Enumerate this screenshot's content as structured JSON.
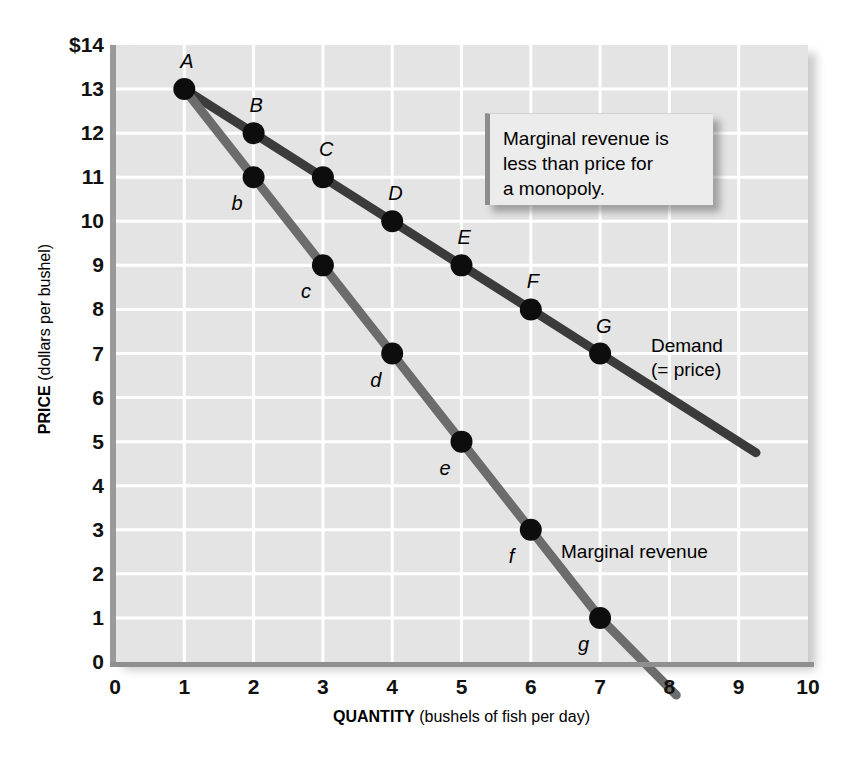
{
  "chart_data": {
    "type": "line",
    "title": "",
    "xlabel": "QUANTITY (bushels of fish per day)",
    "ylabel": "PRICE (dollars per bushel)",
    "xlabel_bold": "QUANTITY",
    "xlabel_rest": " (bushels of fish per day)",
    "ylabel_bold": "PRICE",
    "ylabel_rest": " (dollars per bushel)",
    "xlim": [
      0,
      10
    ],
    "ylim": [
      0,
      14
    ],
    "grid": true,
    "legend_position": "inline-annotation",
    "xticks": [
      "0",
      "1",
      "2",
      "3",
      "4",
      "5",
      "6",
      "7",
      "8",
      "9",
      "10"
    ],
    "yticks": [
      "$14",
      "13",
      "12",
      "11",
      "10",
      "9",
      "8",
      "7",
      "6",
      "5",
      "4",
      "3",
      "2",
      "1",
      "0"
    ],
    "series": [
      {
        "name": "Demand (= price)",
        "color": "#3b3b3b",
        "label_line1": "Demand",
        "label_line2": "(= price)",
        "x": [
          1,
          2,
          3,
          4,
          5,
          6,
          7
        ],
        "values": [
          13,
          12,
          11,
          10,
          9,
          8,
          7
        ],
        "point_labels": [
          "A",
          "B",
          "C",
          "D",
          "E",
          "F",
          "G"
        ],
        "extends_to_x": 9.25,
        "extends_to_y": 4.75
      },
      {
        "name": "Marginal revenue",
        "color": "#6c6c6c",
        "label_line1": "Marginal revenue",
        "label_line2": "",
        "x": [
          1,
          2,
          3,
          4,
          5,
          6,
          7
        ],
        "values": [
          13,
          11,
          9,
          7,
          5,
          3,
          1
        ],
        "point_labels": [
          "A",
          "b",
          "c",
          "d",
          "e",
          "f",
          "g"
        ],
        "extends_to_x": 8.1,
        "extends_to_y": -0.75
      }
    ],
    "annotations": [
      {
        "name": "callout",
        "line1": "Marginal revenue is",
        "line2": "less than price for",
        "line3": "a monopoly."
      }
    ]
  },
  "colors": {
    "plot_background": "#e4e4e4",
    "gridline": "#ffffff",
    "demand": "#3b3b3b",
    "marginal_revenue": "#6c6c6c",
    "point_marker": "#0d0d0d",
    "axis": "#9a9a9a"
  }
}
